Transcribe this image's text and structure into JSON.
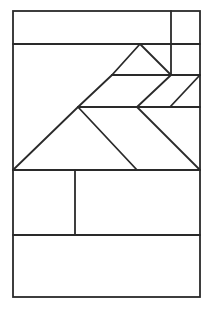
{
  "figure": {
    "stroke_color": "#2a2a2a",
    "background": "#ffffff",
    "outer_rect": {
      "x1": 13,
      "y1": 11,
      "x2": 200,
      "y2": 297
    },
    "segments": [
      {
        "name": "top-strip-divider",
        "x1": 13,
        "y1": 44,
        "x2": 200,
        "y2": 44
      },
      {
        "name": "top-right-vertical",
        "x1": 171,
        "y1": 11,
        "x2": 171,
        "y2": 75
      },
      {
        "name": "small-triangle-left",
        "x1": 140,
        "y1": 44,
        "x2": 112,
        "y2": 75
      },
      {
        "name": "small-triangle-right",
        "x1": 140,
        "y1": 44,
        "x2": 171,
        "y2": 75
      },
      {
        "name": "mid-line-upper",
        "x1": 112,
        "y1": 75,
        "x2": 200,
        "y2": 75
      },
      {
        "name": "parallelogram-diag-1",
        "x1": 171,
        "y1": 75,
        "x2": 137,
        "y2": 107
      },
      {
        "name": "parallelogram-diag-2",
        "x1": 200,
        "y1": 75,
        "x2": 170,
        "y2": 107
      },
      {
        "name": "upper-left-diagonal",
        "x1": 112,
        "y1": 75,
        "x2": 78,
        "y2": 107
      },
      {
        "name": "mid-line-lower",
        "x1": 78,
        "y1": 107,
        "x2": 200,
        "y2": 107
      },
      {
        "name": "big-triangle-left",
        "x1": 78,
        "y1": 107,
        "x2": 13,
        "y2": 170
      },
      {
        "name": "big-triangle-right",
        "x1": 78,
        "y1": 107,
        "x2": 137,
        "y2": 170
      },
      {
        "name": "right-diagonal",
        "x1": 137,
        "y1": 107,
        "x2": 200,
        "y2": 170
      },
      {
        "name": "base-line",
        "x1": 13,
        "y1": 170,
        "x2": 200,
        "y2": 170
      },
      {
        "name": "lower-vertical",
        "x1": 75,
        "y1": 170,
        "x2": 75,
        "y2": 235
      },
      {
        "name": "bottom-strip-divider",
        "x1": 13,
        "y1": 235,
        "x2": 200,
        "y2": 235
      }
    ]
  }
}
